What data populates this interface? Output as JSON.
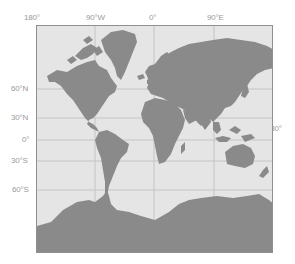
{
  "map": {
    "projection": "Mercator",
    "colors": {
      "ocean": "#e5e5e5",
      "land": "#8a8a8a",
      "grid": "#c4c4c4",
      "frame": "#8f8f8f",
      "label": "#9a9a9a"
    },
    "longitude_labels": [
      "180°",
      "90°W",
      "0°",
      "90°E"
    ],
    "right_label": "180°",
    "latitude_labels": [
      "60°N",
      "30°N",
      "0°",
      "30°S",
      "60°S"
    ]
  }
}
